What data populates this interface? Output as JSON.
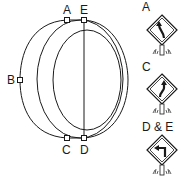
{
  "diagram": {
    "points": [
      {
        "id": "A",
        "label": "A",
        "x": 67,
        "y": 20
      },
      {
        "id": "E",
        "label": "E",
        "x": 84,
        "y": 20
      },
      {
        "id": "B",
        "label": "B",
        "x": 20,
        "y": 80
      },
      {
        "id": "C",
        "label": "C",
        "x": 67,
        "y": 138
      },
      {
        "id": "D",
        "label": "D",
        "x": 84,
        "y": 138
      }
    ],
    "signs": [
      {
        "label": "A",
        "icon": "curve-left-road-sign-icon"
      },
      {
        "label": "C",
        "icon": "reverse-curve-road-sign-icon"
      },
      {
        "label": "D & E",
        "icon": "turn-left-road-sign-icon"
      }
    ],
    "colors": {
      "stroke": "#1a1a1a",
      "background": "#ffffff"
    }
  }
}
